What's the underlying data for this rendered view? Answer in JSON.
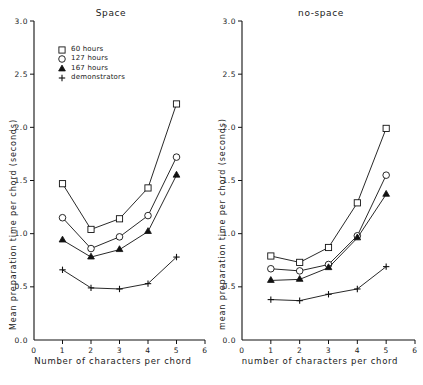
{
  "figure": {
    "marker_shapes": [
      "square",
      "circle",
      "triangle",
      "plus"
    ]
  },
  "legend": {
    "items": [
      {
        "label": "60 hours",
        "marker": "square-marker-icon"
      },
      {
        "label": "127 hours",
        "marker": "circle-marker-icon"
      },
      {
        "label": "167 hours",
        "marker": "triangle-marker-icon"
      },
      {
        "label": "demonstrators",
        "marker": "plus-marker-icon"
      }
    ]
  },
  "chart_data": [
    {
      "type": "line",
      "panel": "left",
      "title": "Space",
      "xlabel": "Number of characters per chord",
      "ylabel": "Mean preparation time per chord (seconds)",
      "x": [
        1,
        2,
        3,
        4,
        5
      ],
      "xlim": [
        0,
        6
      ],
      "ylim": [
        0,
        3.0
      ],
      "xticks": [
        0,
        1,
        2,
        3,
        4,
        5,
        6
      ],
      "xticklabels": [
        "0",
        "1",
        "2",
        "3",
        "4",
        "5",
        "6"
      ],
      "yticks": [
        0.0,
        0.5,
        1.0,
        1.5,
        2.0,
        2.5,
        3.0
      ],
      "yticklabels": [
        "0.0",
        "0.5",
        "1.0",
        "1.5",
        "2.0",
        "2.5",
        "3.0"
      ],
      "grid": false,
      "legend_position": "upper left",
      "series": [
        {
          "name": "60 hours",
          "marker": "square",
          "values": [
            1.47,
            1.04,
            1.14,
            1.43,
            2.22
          ]
        },
        {
          "name": "127 hours",
          "marker": "circle",
          "values": [
            1.15,
            0.86,
            0.97,
            1.17,
            1.72
          ]
        },
        {
          "name": "167 hours",
          "marker": "triangle",
          "values": [
            0.94,
            0.78,
            0.85,
            1.02,
            1.55
          ]
        },
        {
          "name": "demonstrators",
          "marker": "plus",
          "values": [
            0.66,
            0.49,
            0.48,
            0.53,
            0.78
          ]
        }
      ]
    },
    {
      "type": "line",
      "panel": "right",
      "title": "no-space",
      "xlabel": "number of characters per chord",
      "ylabel": "mean preparation time per chord (seconds)",
      "x": [
        1,
        2,
        3,
        4,
        5
      ],
      "xlim": [
        0,
        6
      ],
      "ylim": [
        0,
        3.0
      ],
      "xticks": [
        0,
        1,
        2,
        3,
        4,
        5,
        6
      ],
      "xticklabels": [
        "0",
        "1",
        "2",
        "3",
        "4",
        "5",
        "6"
      ],
      "yticks": [
        0.0,
        0.5,
        1.0,
        1.5,
        2.0,
        2.5,
        3.0
      ],
      "yticklabels": [
        "0.0",
        "0.5",
        "1.0",
        "1.5",
        "2.0",
        "2.5",
        "3.0"
      ],
      "grid": false,
      "legend_position": "none",
      "series": [
        {
          "name": "60 hours",
          "marker": "square",
          "values": [
            0.79,
            0.73,
            0.87,
            1.29,
            1.99
          ]
        },
        {
          "name": "127 hours",
          "marker": "circle",
          "values": [
            0.67,
            0.65,
            0.71,
            0.98,
            1.55
          ]
        },
        {
          "name": "167 hours",
          "marker": "triangle",
          "values": [
            0.56,
            0.57,
            0.68,
            0.96,
            1.37
          ]
        },
        {
          "name": "demonstrators",
          "marker": "plus",
          "values": [
            0.38,
            0.37,
            0.43,
            0.48,
            0.69
          ]
        }
      ]
    }
  ]
}
